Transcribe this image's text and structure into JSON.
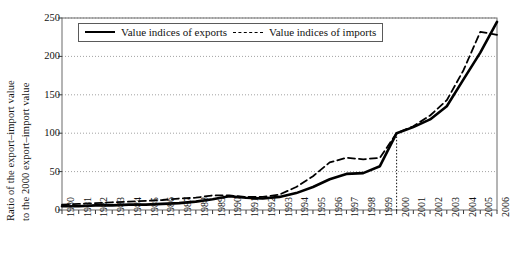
{
  "chart_data": {
    "type": "line",
    "title": "",
    "xlabel": "",
    "ylabel_line1": "Ratio of the export–import value",
    "ylabel_line2": "to the 2000 export–import value",
    "ylim": [
      0,
      250
    ],
    "yticks": [
      0,
      50,
      100,
      150,
      200,
      250
    ],
    "grid": "horizontal-dotted",
    "legend_position": "top-left-inside",
    "reference_line": {
      "x": "2000",
      "y": 100,
      "style": "dotted-vertical"
    },
    "x": [
      "1980",
      "1981",
      "1982",
      "1983",
      "1984",
      "1985",
      "1986",
      "1987",
      "1988",
      "1989",
      "1990",
      "1991",
      "1992",
      "1993",
      "1994",
      "1995",
      "1996",
      "1997",
      "1998",
      "1999",
      "2000",
      "2001",
      "2002",
      "2003",
      "2004",
      "2005",
      "2006"
    ],
    "categories": [
      "1980",
      "1981",
      "1982",
      "1983",
      "1984",
      "1985",
      "1986",
      "1987",
      "1988",
      "1989",
      "1990",
      "1991",
      "1992",
      "1993",
      "1994",
      "1995",
      "1996",
      "1997",
      "1998",
      "1999",
      "2000",
      "2001",
      "2002",
      "2003",
      "2004",
      "2005",
      "2006"
    ],
    "series": [
      {
        "name": "Value indices of exports",
        "style": "solid",
        "color": "#000000",
        "values": [
          5,
          5,
          6,
          6,
          7,
          7,
          8,
          9,
          11,
          14,
          18,
          16,
          15,
          17,
          22,
          30,
          40,
          47,
          48,
          57,
          100,
          108,
          118,
          135,
          170,
          205,
          245
        ]
      },
      {
        "name": "Value indices of imports",
        "style": "dashed",
        "color": "#000000",
        "values": [
          7,
          8,
          9,
          10,
          11,
          12,
          13,
          15,
          16,
          19,
          19,
          17,
          17,
          20,
          30,
          44,
          62,
          68,
          66,
          68,
          100,
          109,
          123,
          143,
          182,
          232,
          228
        ]
      }
    ]
  },
  "legend": {
    "items": [
      {
        "label": "Value indices of exports",
        "style": "solid"
      },
      {
        "label": "Value indices of imports",
        "style": "dashed"
      }
    ]
  }
}
